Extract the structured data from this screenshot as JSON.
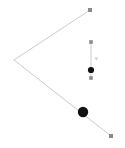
{
  "canvas": {
    "width": 125,
    "height": 148,
    "background": "#ffffff"
  },
  "style": {
    "line_color": "#b4b4b4",
    "line_width": 0.7,
    "square_marker_color": "#8a8a8a",
    "square_marker_size": 4,
    "dot_color": "#111111",
    "label_color": "#9a9a9a"
  },
  "figure": {
    "annotation_text": "v"
  },
  "chart_data": {
    "type": "scatter",
    "title": "",
    "xlabel": "",
    "ylabel": "",
    "xlim": [
      0,
      125
    ],
    "ylim": [
      148,
      0
    ],
    "grid": false,
    "legend": "none",
    "series": [
      {
        "name": "angle-upper-arm",
        "kind": "line",
        "color": "#b4b4b4",
        "width": 0.7,
        "points": [
          {
            "x": 90,
            "y": 10
          },
          {
            "x": 14,
            "y": 60
          }
        ]
      },
      {
        "name": "angle-lower-arm",
        "kind": "line",
        "color": "#b4b4b4",
        "width": 0.7,
        "points": [
          {
            "x": 14,
            "y": 60
          },
          {
            "x": 111,
            "y": 136
          }
        ]
      },
      {
        "name": "vertical-segment",
        "kind": "line",
        "color": "#b4b4b4",
        "width": 0.7,
        "points": [
          {
            "x": 91,
            "y": 42
          },
          {
            "x": 91,
            "y": 78
          }
        ]
      }
    ],
    "markers": [
      {
        "name": "endpoint-top-right",
        "shape": "square",
        "x": 90,
        "y": 10,
        "size": 4,
        "color": "#8a8a8a"
      },
      {
        "name": "endpoint-bottom-right",
        "shape": "square",
        "x": 111,
        "y": 136,
        "size": 4,
        "color": "#8a8a8a"
      },
      {
        "name": "segment-top-endpoint",
        "shape": "square",
        "x": 91,
        "y": 42,
        "size": 3.6,
        "color": "#8a8a8a"
      },
      {
        "name": "segment-bottom-endpoint",
        "shape": "square",
        "x": 91,
        "y": 78,
        "size": 3.6,
        "color": "#8a8a8a"
      },
      {
        "name": "point-on-lower-arm",
        "shape": "circle",
        "x": 83,
        "y": 112,
        "size": 5.2,
        "color": "#111111"
      },
      {
        "name": "point-on-segment",
        "shape": "circle",
        "x": 91,
        "y": 70,
        "size": 3.1,
        "color": "#111111"
      }
    ],
    "annotations": [
      {
        "name": "segment-label",
        "text": "v",
        "x": 95,
        "y": 58
      }
    ]
  }
}
